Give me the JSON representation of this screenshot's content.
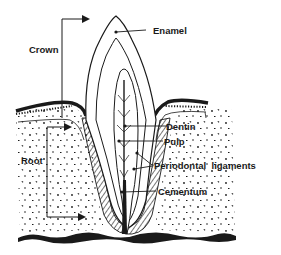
{
  "diagram": {
    "colors": {
      "ink": "#1a1a1a",
      "background": "#ffffff"
    },
    "labels": {
      "crown": "Crown",
      "root": "Root",
      "enamel": "Enamel",
      "dentin": "Dentin",
      "pulp": "Pulp",
      "periodontal_ligaments": "Periodontal  ligaments",
      "cementum": "Cementum"
    }
  }
}
